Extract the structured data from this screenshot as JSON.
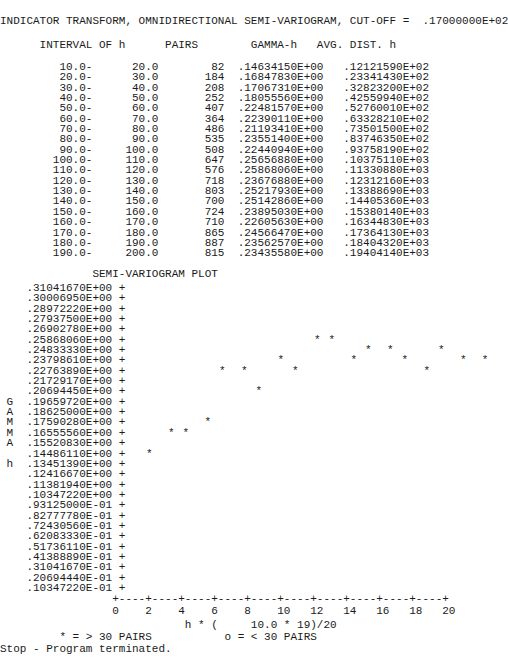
{
  "report": {
    "title": "INDICATOR TRANSFORM, OMNIDIRECTIONAL SEMI-VARIOGRAM, CUT-OFF =  .17000000E+02",
    "cut_off_value": ".17000000E+02",
    "stop_message": "Stop - Program terminated."
  },
  "table": {
    "headers": {
      "interval": "INTERVAL OF h",
      "pairs": "PAIRS",
      "gamma": "GAMMA-h",
      "avg_dist": "AVG. DIST. h"
    },
    "header_line": "      INTERVAL OF h      PAIRS        GAMMA-h   AVG. DIST. h",
    "rows": [
      {
        "from": "10.0-",
        "to": "20.0",
        "pairs": "82",
        "gamma": ".14634150E+00",
        "avg_dist": ".12121590E+02"
      },
      {
        "from": "20.0-",
        "to": "30.0",
        "pairs": "184",
        "gamma": ".16847830E+00",
        "avg_dist": ".23341430E+02"
      },
      {
        "from": "30.0-",
        "to": "40.0",
        "pairs": "208",
        "gamma": ".17067310E+00",
        "avg_dist": ".32823200E+02"
      },
      {
        "from": "40.0-",
        "to": "50.0",
        "pairs": "252",
        "gamma": ".18055560E+00",
        "avg_dist": ".42559940E+02"
      },
      {
        "from": "50.0-",
        "to": "60.0",
        "pairs": "407",
        "gamma": ".22481570E+00",
        "avg_dist": ".52760010E+02"
      },
      {
        "from": "60.0-",
        "to": "70.0",
        "pairs": "364",
        "gamma": ".22390110E+00",
        "avg_dist": ".63328210E+02"
      },
      {
        "from": "70.0-",
        "to": "80.0",
        "pairs": "486",
        "gamma": ".21193410E+00",
        "avg_dist": ".73501500E+02"
      },
      {
        "from": "80.0-",
        "to": "90.0",
        "pairs": "535",
        "gamma": ".23551400E+00",
        "avg_dist": ".83746350E+02"
      },
      {
        "from": "90.0-",
        "to": "100.0",
        "pairs": "508",
        "gamma": ".22440940E+00",
        "avg_dist": ".93758190E+02"
      },
      {
        "from": "100.0-",
        "to": "110.0",
        "pairs": "647",
        "gamma": ".25656880E+00",
        "avg_dist": ".10375110E+03"
      },
      {
        "from": "110.0-",
        "to": "120.0",
        "pairs": "576",
        "gamma": ".25868060E+00",
        "avg_dist": ".11330880E+03"
      },
      {
        "from": "120.0-",
        "to": "130.0",
        "pairs": "718",
        "gamma": ".23676880E+00",
        "avg_dist": ".12312160E+03"
      },
      {
        "from": "130.0-",
        "to": "140.0",
        "pairs": "803",
        "gamma": ".25217930E+00",
        "avg_dist": ".13388690E+03"
      },
      {
        "from": "140.0-",
        "to": "150.0",
        "pairs": "700",
        "gamma": ".25142860E+00",
        "avg_dist": ".14405360E+03"
      },
      {
        "from": "150.0-",
        "to": "160.0",
        "pairs": "724",
        "gamma": ".23895030E+00",
        "avg_dist": ".15380140E+03"
      },
      {
        "from": "160.0-",
        "to": "170.0",
        "pairs": "710",
        "gamma": ".22605630E+00",
        "avg_dist": ".16344830E+03"
      },
      {
        "from": "170.0-",
        "to": "180.0",
        "pairs": "865",
        "gamma": ".24566470E+00",
        "avg_dist": ".17364130E+03"
      },
      {
        "from": "180.0-",
        "to": "190.0",
        "pairs": "887",
        "gamma": ".23562570E+00",
        "avg_dist": ".18404320E+03"
      },
      {
        "from": "190.0-",
        "to": "200.0",
        "pairs": "815",
        "gamma": ".23435580E+00",
        "avg_dist": ".19404140E+03"
      }
    ]
  },
  "plot": {
    "title": "SEMI-VARIOGRAM PLOT",
    "y_axis_caption": "GAMMA h",
    "y_axis_caption_chars": [
      "G",
      "A",
      "M",
      "M",
      "A",
      "",
      "h"
    ],
    "y_axis_caption_first_row": 11,
    "axis_tick_char": "+",
    "axis_line": "+----+----+----+----+----+----+----+----+----+----+",
    "tick_label_line": "0    2    4    6    8    10   12   14   16   18   20",
    "x_label": "h * (     10.0 * 19)/20",
    "legend_star": "* = > 30 PAIRS",
    "legend_circle": "o = < 30 PAIRS",
    "y_tick_labels": [
      ".31041670E+00",
      ".30006950E+00",
      ".28972220E+00",
      ".27937500E+00",
      ".26902780E+00",
      ".25868060E+00",
      ".24833330E+00",
      ".23798610E+00",
      ".22763890E+00",
      ".21729170E+00",
      ".20694450E+00",
      ".19659720E+00",
      ".18625000E+00",
      ".17590280E+00",
      ".16555560E+00",
      ".15520830E+00",
      ".14486110E+00",
      ".13451390E+00",
      ".12416670E+00",
      ".11381940E+00",
      ".10347220E+00",
      ".93125000E-01",
      ".82777780E-01",
      ".72430560E-01",
      ".62083330E-01",
      ".51736110E-01",
      ".41388890E-01",
      ".31041670E-01",
      ".20694440E-01",
      ".10347220E-01"
    ]
  },
  "chart_data": {
    "type": "scatter",
    "title": "SEMI-VARIOGRAM PLOT",
    "xlabel": "h * (     10.0 * 19)/20",
    "ylabel": "GAMMA h",
    "xlim": [
      0,
      20
    ],
    "ylim": [
      0.01034722,
      0.3104167
    ],
    "x_ticks": [
      0,
      2,
      4,
      6,
      8,
      10,
      12,
      14,
      16,
      18,
      20
    ],
    "marker_star_meaning": "* = > 30 PAIRS",
    "marker_circle_meaning": "o = < 30 PAIRS",
    "grid": false,
    "legend": "below-axis",
    "x": [
      1.212159,
      2.334143,
      3.28232,
      4.255994,
      5.276001,
      6.332821,
      7.35015,
      8.374635,
      9.375819,
      10.37511,
      11.33088,
      12.31216,
      13.38869,
      14.40536,
      15.38014,
      16.34483,
      17.36413,
      18.40432,
      19.40414
    ],
    "y": [
      0.1463415,
      0.1684783,
      0.1706731,
      0.1805556,
      0.2248157,
      0.2239011,
      0.2119341,
      0.235514,
      0.2244094,
      0.2565688,
      0.2586806,
      0.2367688,
      0.2521793,
      0.2514286,
      0.2389503,
      0.2260563,
      0.2456647,
      0.2356257,
      0.2343558
    ],
    "markers": [
      "*",
      "*",
      "*",
      "*",
      "*",
      "*",
      "*",
      "*",
      "*",
      "*",
      "*",
      "*",
      "*",
      "*",
      "*",
      "*",
      "*",
      "*",
      "*"
    ],
    "pairs": [
      82,
      184,
      208,
      252,
      407,
      364,
      486,
      535,
      508,
      647,
      576,
      718,
      803,
      700,
      724,
      710,
      865,
      887,
      815
    ]
  }
}
